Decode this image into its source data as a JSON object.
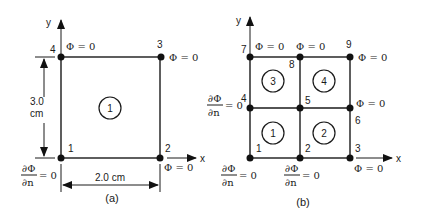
{
  "figure_a": {
    "caption": "(a)",
    "axis_x": "x",
    "axis_y": "y",
    "nodes": [
      {
        "id": "1",
        "label": "1"
      },
      {
        "id": "2",
        "label": "2"
      },
      {
        "id": "3",
        "label": "3"
      },
      {
        "id": "4",
        "label": "4"
      }
    ],
    "element": "1",
    "height_dim": {
      "value": "3.0",
      "unit": "cm"
    },
    "width_dim": "2.0 cm",
    "bc": {
      "node4": "Φ = 0",
      "node3": "Φ = 0",
      "node2": "Φ = 0",
      "node1_num": "∂Φ",
      "node1_den": "∂n",
      "node1_eq": "= 0"
    }
  },
  "figure_b": {
    "caption": "(b)",
    "axis_x": "x",
    "axis_y": "y",
    "nodes": [
      {
        "id": "1",
        "label": "1"
      },
      {
        "id": "2",
        "label": "2"
      },
      {
        "id": "3",
        "label": "3"
      },
      {
        "id": "4",
        "label": "4"
      },
      {
        "id": "5",
        "label": "5"
      },
      {
        "id": "6",
        "label": "6"
      },
      {
        "id": "7",
        "label": "7"
      },
      {
        "id": "8",
        "label": "8"
      },
      {
        "id": "9",
        "label": "9"
      }
    ],
    "elements": [
      "1",
      "2",
      "3",
      "4"
    ],
    "bc": {
      "node7": "Φ = 0",
      "node8": "Φ = 0",
      "node9": "Φ = 0",
      "node6": "Φ = 0",
      "node3": "Φ = 0",
      "dn_num": "∂Φ",
      "dn_den": "∂n",
      "dn_eq": "= 0"
    }
  }
}
